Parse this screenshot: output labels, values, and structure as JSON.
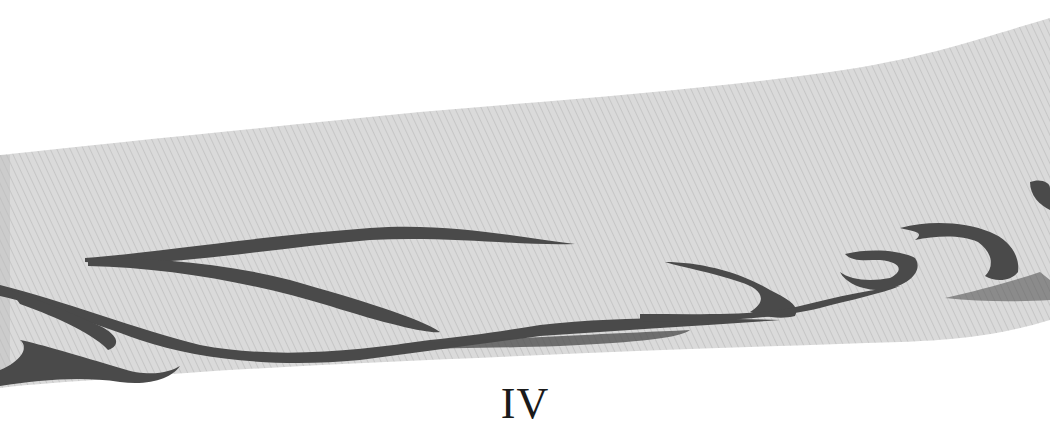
{
  "figure": {
    "caption": "IV",
    "colors": {
      "background": "#ffffff",
      "band": "#d9d9d9",
      "band_texture": "#c9c9c9",
      "stroke": "#4a4a4a",
      "caption": "#1a1a1a"
    }
  }
}
